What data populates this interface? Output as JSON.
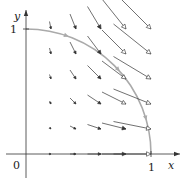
{
  "figure": {
    "type": "vector-field",
    "field_formula": "F(x,y) = (x^2, -xy)",
    "axes": {
      "x_label": "x",
      "y_label": "y",
      "origin_label": "0",
      "x_tick_label": "1",
      "y_tick_label": "1",
      "x_range": [
        0,
        1.15
      ],
      "y_range": [
        0,
        1.15
      ]
    },
    "grid": {
      "x_values": [
        0.2,
        0.4,
        0.6,
        0.8,
        1.0
      ],
      "y_values": [
        0,
        0.2,
        0.4,
        0.6,
        0.8,
        1.0
      ]
    },
    "curve": {
      "type": "quarter-circle",
      "center": [
        0,
        0
      ],
      "radius": 1,
      "from": [
        0,
        1
      ],
      "to": [
        1,
        0
      ],
      "orientation": "clockwise"
    },
    "colors": {
      "axis": "#333333",
      "vector": "#333333",
      "curve": "#aaaaaa",
      "label": "#222222"
    }
  }
}
